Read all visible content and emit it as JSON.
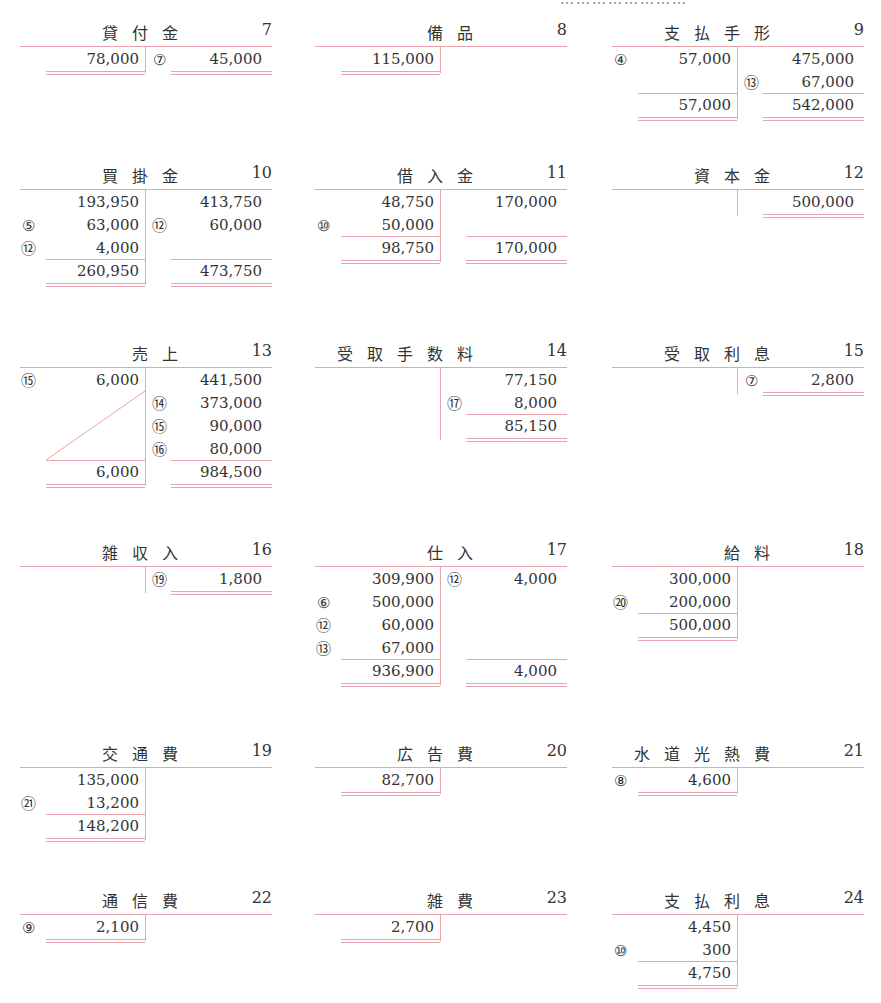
{
  "header_fragment": "……………………",
  "accounts": [
    {
      "name": "貸付金",
      "no": "7",
      "x": 20,
      "y": 18,
      "rows": 3,
      "debit": [
        {
          "m": "",
          "v": "78,000"
        }
      ],
      "credit": [
        {
          "m": "7",
          "v": "45,000"
        }
      ],
      "debit_total": "",
      "credit_total": "",
      "closeDebit": 1,
      "closeCredit": 1,
      "diag": false
    },
    {
      "name": "備品",
      "no": "8",
      "x": 315,
      "y": 18,
      "rows": 1,
      "debit": [
        {
          "m": "",
          "v": "115,000"
        }
      ],
      "credit": [],
      "debit_total": "",
      "credit_total": "",
      "closeDebit": 1,
      "closeCredit": 0,
      "diag": false
    },
    {
      "name": "支払手形",
      "no": "9",
      "x": 612,
      "y": 18,
      "rows": 3,
      "debit": [
        {
          "m": "4",
          "v": "57,000"
        }
      ],
      "credit": [
        {
          "m": "",
          "v": "475,000"
        },
        {
          "m": "13",
          "v": "67,000"
        }
      ],
      "debit_total": "57,000",
      "credit_total": "542,000",
      "closeDebit": 1,
      "closeCredit": 1,
      "diag": false
    },
    {
      "name": "買掛金",
      "no": "10",
      "x": 20,
      "y": 161,
      "rows": 4,
      "debit": [
        {
          "m": "",
          "v": "193,950"
        },
        {
          "m": "5",
          "v": "63,000"
        },
        {
          "m": "12",
          "v": "4,000"
        }
      ],
      "credit": [
        {
          "m": "",
          "v": "413,750"
        },
        {
          "m": "12",
          "v": "60,000"
        }
      ],
      "debit_total": "260,950",
      "credit_total": "473,750",
      "closeDebit": 1,
      "closeCredit": 1,
      "diag": false
    },
    {
      "name": "借入金",
      "no": "11",
      "x": 315,
      "y": 161,
      "rows": 3,
      "debit": [
        {
          "m": "",
          "v": "48,750"
        },
        {
          "m": "10",
          "v": "50,000"
        }
      ],
      "credit": [
        {
          "m": "",
          "v": "170,000"
        }
      ],
      "debit_total": "98,750",
      "credit_total": "170,000",
      "closeDebit": 1,
      "closeCredit": 1,
      "diag": false
    },
    {
      "name": "資本金",
      "no": "12",
      "x": 612,
      "y": 161,
      "rows": 1,
      "debit": [],
      "credit": [
        {
          "m": "",
          "v": "500,000"
        }
      ],
      "debit_total": "",
      "credit_total": "",
      "closeDebit": 0,
      "closeCredit": 1,
      "diag": false
    },
    {
      "name": "売上",
      "no": "13",
      "x": 20,
      "y": 339,
      "rows": 5,
      "debit": [
        {
          "m": "15",
          "v": "6,000"
        }
      ],
      "credit": [
        {
          "m": "",
          "v": "441,500"
        },
        {
          "m": "14",
          "v": "373,000"
        },
        {
          "m": "15",
          "v": "90,000"
        },
        {
          "m": "16",
          "v": "80,000"
        }
      ],
      "debit_total": "6,000",
      "credit_total": "984,500",
      "closeDebit": 1,
      "closeCredit": 1,
      "diag": true
    },
    {
      "name": "受取手数料",
      "no": "14",
      "x": 315,
      "y": 339,
      "rows": 3,
      "debit": [],
      "credit": [
        {
          "m": "",
          "v": "77,150"
        },
        {
          "m": "17",
          "v": "8,000"
        }
      ],
      "debit_total": "",
      "credit_total": "85,150",
      "closeDebit": 0,
      "closeCredit": 1,
      "diag": false
    },
    {
      "name": "受取利息",
      "no": "15",
      "x": 612,
      "y": 339,
      "rows": 1,
      "debit": [],
      "credit": [
        {
          "m": "7",
          "v": "2,800"
        }
      ],
      "debit_total": "",
      "credit_total": "",
      "closeDebit": 0,
      "closeCredit": 1,
      "diag": false
    },
    {
      "name": "雑収入",
      "no": "16",
      "x": 20,
      "y": 538,
      "rows": 1,
      "debit": [],
      "credit": [
        {
          "m": "19",
          "v": "1,800"
        }
      ],
      "debit_total": "",
      "credit_total": "",
      "closeDebit": 0,
      "closeCredit": 1,
      "diag": false
    },
    {
      "name": "仕入",
      "no": "17",
      "x": 315,
      "y": 538,
      "rows": 5,
      "debit": [
        {
          "m": "",
          "v": "309,900"
        },
        {
          "m": "6",
          "v": "500,000"
        },
        {
          "m": "12",
          "v": "60,000"
        },
        {
          "m": "13",
          "v": "67,000"
        }
      ],
      "credit": [
        {
          "m": "12",
          "v": "4,000"
        }
      ],
      "debit_total": "936,900",
      "credit_total": "4,000",
      "closeDebit": 1,
      "closeCredit": 1,
      "diag": false
    },
    {
      "name": "給料",
      "no": "18",
      "x": 612,
      "y": 538,
      "rows": 3,
      "debit": [
        {
          "m": "",
          "v": "300,000"
        },
        {
          "m": "20",
          "v": "200,000"
        }
      ],
      "credit": [],
      "debit_total": "500,000",
      "credit_total": "",
      "closeDebit": 1,
      "closeCredit": 0,
      "diag": false
    },
    {
      "name": "交通費",
      "no": "19",
      "x": 20,
      "y": 739,
      "rows": 3,
      "debit": [
        {
          "m": "",
          "v": "135,000"
        },
        {
          "m": "21",
          "v": "13,200"
        }
      ],
      "credit": [],
      "debit_total": "148,200",
      "credit_total": "",
      "closeDebit": 1,
      "closeCredit": 0,
      "diag": false
    },
    {
      "name": "広告費",
      "no": "20",
      "x": 315,
      "y": 739,
      "rows": 1,
      "debit": [
        {
          "m": "",
          "v": "82,700"
        }
      ],
      "credit": [],
      "debit_total": "",
      "credit_total": "",
      "closeDebit": 1,
      "closeCredit": 0,
      "diag": false
    },
    {
      "name": "水道光熱費",
      "no": "21",
      "x": 612,
      "y": 739,
      "rows": 1,
      "debit": [
        {
          "m": "8",
          "v": "4,600"
        }
      ],
      "credit": [],
      "debit_total": "",
      "credit_total": "",
      "closeDebit": 1,
      "closeCredit": 0,
      "diag": false
    },
    {
      "name": "通信費",
      "no": "22",
      "x": 20,
      "y": 886,
      "rows": 1,
      "debit": [
        {
          "m": "9",
          "v": "2,100"
        }
      ],
      "credit": [],
      "debit_total": "",
      "credit_total": "",
      "closeDebit": 1,
      "closeCredit": 0,
      "diag": false
    },
    {
      "name": "雑費",
      "no": "23",
      "x": 315,
      "y": 886,
      "rows": 1,
      "debit": [
        {
          "m": "",
          "v": "2,700"
        }
      ],
      "credit": [],
      "debit_total": "",
      "credit_total": "",
      "closeDebit": 1,
      "closeCredit": 0,
      "diag": false
    },
    {
      "name": "支払利息",
      "no": "24",
      "x": 612,
      "y": 886,
      "rows": 3,
      "debit": [
        {
          "m": "",
          "v": "4,450"
        },
        {
          "m": "10",
          "v": "300"
        }
      ],
      "credit": [],
      "debit_total": "4,750",
      "credit_total": "",
      "closeDebit": 1,
      "closeCredit": 0,
      "diag": false
    }
  ]
}
